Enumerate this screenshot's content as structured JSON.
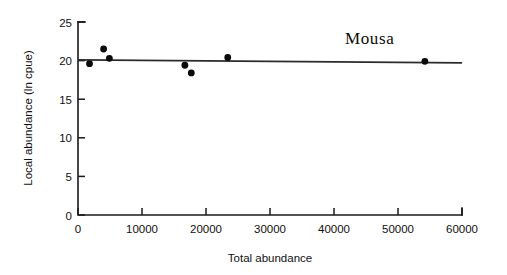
{
  "chart_data": {
    "type": "scatter",
    "title": "Mousa",
    "xlabel": "Total abundance",
    "ylabel": "Local abundance (ln cpue)",
    "xlim": [
      0,
      60000
    ],
    "ylim": [
      0,
      25
    ],
    "xticks": [
      0,
      10000,
      20000,
      30000,
      40000,
      50000,
      60000
    ],
    "xtick_labels": [
      "0",
      "10000",
      "20000",
      "30000",
      "40000",
      "50000",
      "60000"
    ],
    "yticks": [
      0,
      5,
      10,
      15,
      20,
      25
    ],
    "ytick_labels": [
      "0",
      "5",
      "10",
      "15",
      "20",
      "25"
    ],
    "grid": false,
    "legend": false,
    "legend_position": "none",
    "series": [
      {
        "name": "observations",
        "marker": "filled-circle",
        "color": "#0b0b0b",
        "points": [
          {
            "x": 1800,
            "y": 19.6
          },
          {
            "x": 4000,
            "y": 21.5
          },
          {
            "x": 4900,
            "y": 20.3
          },
          {
            "x": 16700,
            "y": 19.4
          },
          {
            "x": 17700,
            "y": 18.4
          },
          {
            "x": 23400,
            "y": 20.4
          },
          {
            "x": 54200,
            "y": 19.9
          }
        ]
      },
      {
        "name": "regression-line",
        "marker": "line",
        "color": "#2b2b2b",
        "points": [
          {
            "x": 0,
            "y": 20.1
          },
          {
            "x": 60000,
            "y": 19.7
          }
        ]
      }
    ]
  },
  "figure": {
    "background_color": "#ffffff",
    "axis_color": "#1a1a1a",
    "marker_color": "#0b0b0b",
    "line_color": "#2b2b2b"
  }
}
